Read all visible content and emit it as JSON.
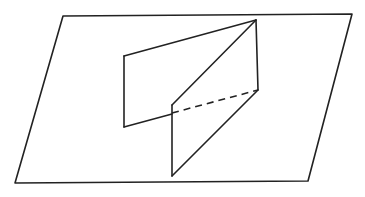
{
  "diagram": {
    "type": "geometry",
    "colors": {
      "background": "#ffffff",
      "stroke": "#222222"
    },
    "plane": {
      "points": [
        [
          63,
          16
        ],
        [
          352,
          14
        ],
        [
          308,
          181
        ],
        [
          15,
          183
        ]
      ]
    },
    "segments": [
      {
        "name": "back-panel-top-edge",
        "from": [
          124,
          56
        ],
        "to": [
          256,
          20
        ],
        "style": "solid"
      },
      {
        "name": "back-panel-left-edge",
        "from": [
          124,
          56
        ],
        "to": [
          124,
          127
        ],
        "style": "solid"
      },
      {
        "name": "back-panel-bottom-edge",
        "from": [
          124,
          127
        ],
        "to": [
          172,
          114
        ],
        "style": "solid"
      },
      {
        "name": "common-edge-diagonal",
        "from": [
          256,
          20
        ],
        "to": [
          172,
          105
        ],
        "style": "solid"
      },
      {
        "name": "back-right-vertical-edge",
        "from": [
          256,
          20
        ],
        "to": [
          258,
          90
        ],
        "style": "solid"
      },
      {
        "name": "front-panel-vertical-edge",
        "from": [
          172,
          105
        ],
        "to": [
          172,
          176
        ],
        "style": "solid"
      },
      {
        "name": "front-panel-diagonal-edge",
        "from": [
          172,
          176
        ],
        "to": [
          258,
          90
        ],
        "style": "solid"
      },
      {
        "name": "hidden-intersection-line",
        "from": [
          172,
          113
        ],
        "to": [
          258,
          90
        ],
        "style": "dashed"
      }
    ]
  }
}
